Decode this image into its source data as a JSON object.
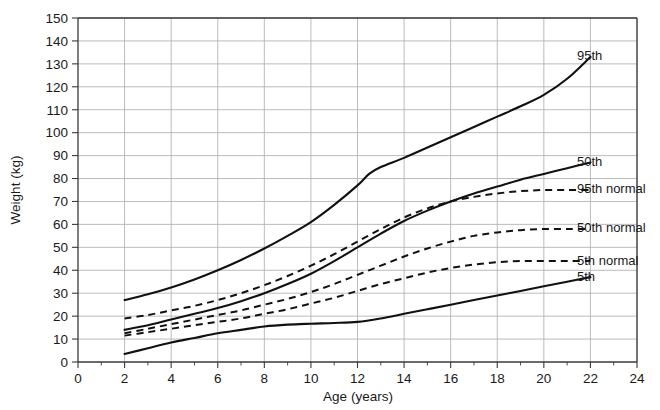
{
  "chart_data": {
    "type": "line",
    "title": "",
    "xlabel": "Age (years)",
    "ylabel": "Weight (kg)",
    "xlim": [
      0,
      24
    ],
    "ylim": [
      0,
      150
    ],
    "xticks": [
      0,
      2,
      4,
      6,
      8,
      10,
      12,
      14,
      16,
      18,
      20,
      22,
      24
    ],
    "yticks": [
      0,
      10,
      20,
      30,
      40,
      50,
      60,
      70,
      80,
      90,
      100,
      110,
      120,
      130,
      140,
      150
    ],
    "xtick_labels": [
      "0",
      "2",
      "4",
      "6",
      "8",
      "10",
      "12",
      "14",
      "16",
      "18",
      "20",
      "22",
      "24"
    ],
    "ytick_labels": [
      "0",
      "10",
      "20",
      "30",
      "40",
      "50",
      "60",
      "70",
      "80",
      "90",
      "100",
      "110",
      "120",
      "130",
      "140",
      "150"
    ],
    "x_minor_ticks": [
      1,
      3,
      5,
      7,
      9,
      11,
      13,
      15,
      17,
      19,
      21,
      23
    ],
    "grid": true,
    "grid_color": "#b4b4b4",
    "legend_position": "right-inline",
    "line_color": "#111111",
    "series": [
      {
        "name": "95th",
        "label": "95th",
        "style": "solid",
        "label_y": 133,
        "x": [
          2,
          3,
          4,
          5,
          6,
          7,
          8,
          9,
          10,
          11,
          12,
          12.5,
          13,
          14,
          15,
          16,
          17,
          18,
          19,
          20,
          21,
          22
        ],
        "values": [
          27,
          29.5,
          32.5,
          36,
          40,
          44.5,
          49.5,
          55,
          61,
          68.5,
          77,
          82,
          85,
          89,
          93.5,
          98,
          102.5,
          107,
          111.5,
          116.5,
          123.5,
          133
        ]
      },
      {
        "name": "50th",
        "label": "50th",
        "style": "solid",
        "label_y": 87,
        "x": [
          2,
          3,
          4,
          5,
          6,
          7,
          8,
          9,
          10,
          11,
          12,
          13,
          14,
          15,
          16,
          17,
          18,
          19,
          20,
          21,
          22
        ],
        "values": [
          14,
          16,
          18.5,
          21,
          23.5,
          26.5,
          30,
          34,
          38.5,
          44,
          50,
          56,
          61.5,
          66,
          70,
          73.5,
          76.5,
          79.5,
          82,
          84.5,
          87
        ]
      },
      {
        "name": "95th normal",
        "label": "95th normal",
        "style": "dashed",
        "label_y": 75,
        "x": [
          2,
          3,
          4,
          5,
          6,
          7,
          8,
          9,
          10,
          11,
          12,
          13,
          14,
          15,
          16,
          17,
          18,
          19,
          20,
          21,
          22
        ],
        "values": [
          19,
          20.5,
          22.5,
          24.5,
          27,
          30,
          33.5,
          37.5,
          42,
          47,
          52.5,
          58,
          63,
          67,
          70,
          72,
          73.5,
          74.5,
          75,
          75,
          75
        ]
      },
      {
        "name": "50th normal",
        "label": "50th normal",
        "style": "dashed",
        "label_y": 58,
        "x": [
          2,
          3,
          4,
          5,
          6,
          7,
          8,
          9,
          10,
          11,
          12,
          13,
          14,
          15,
          16,
          17,
          18,
          19,
          20,
          21,
          22
        ],
        "values": [
          12.5,
          14.5,
          16.5,
          18.5,
          20.5,
          22.5,
          25,
          27.5,
          30.5,
          34,
          38,
          42,
          46,
          49.5,
          52.5,
          55,
          56.5,
          57.5,
          58,
          58,
          58
        ]
      },
      {
        "name": "5th normal",
        "label": "5th normal",
        "style": "dashed",
        "label_y": 44,
        "x": [
          2,
          3,
          4,
          5,
          6,
          7,
          8,
          9,
          10,
          11,
          12,
          13,
          14,
          15,
          16,
          17,
          18,
          19,
          20,
          21,
          22
        ],
        "values": [
          11.5,
          13,
          14.5,
          16,
          17.5,
          19,
          21,
          23,
          25.5,
          28,
          31,
          34,
          36.5,
          39,
          41,
          42.5,
          43.5,
          44,
          44,
          44,
          44
        ]
      },
      {
        "name": "5th",
        "label": "5th",
        "style": "solid",
        "label_y": 37,
        "x": [
          2,
          3,
          4,
          5,
          6,
          7,
          8,
          9,
          10,
          11,
          12,
          13,
          14,
          15,
          16,
          17,
          18,
          19,
          20,
          21,
          22
        ],
        "values": [
          3.5,
          6,
          8.5,
          10.5,
          12.5,
          14,
          15.5,
          16.3,
          16.7,
          17,
          17.5,
          19,
          21,
          23,
          25,
          27,
          29,
          31,
          33,
          35,
          37
        ]
      }
    ]
  }
}
